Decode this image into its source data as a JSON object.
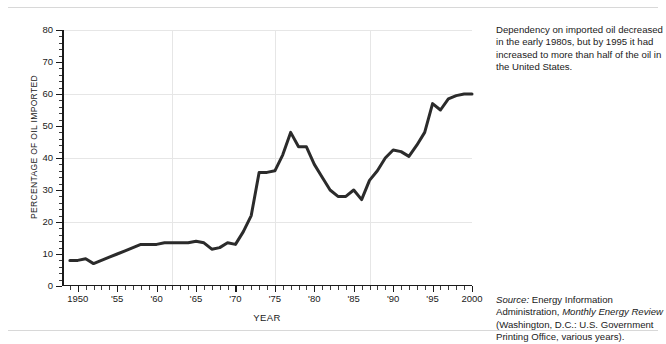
{
  "caption": "Dependency on imported oil decreased in the early 1980s, but by 1995 it had increased to more than half of the oil in the United States.",
  "source": {
    "label": "Source:",
    "text_before": " Energy Information Administration, ",
    "publication": "Monthly Energy Review",
    "text_after": " (Washington, D.C.: U.S. Government Printing Office, various years)."
  },
  "chart_data": {
    "type": "line",
    "title": "",
    "xlabel": "YEAR",
    "ylabel": "PERCENTAGE OF OIL IMPORTED",
    "xlim": [
      1948,
      2000
    ],
    "ylim": [
      0,
      80
    ],
    "grid": "major gridlines at y = 20, 40, 60, 80 and vertical gridlines at x = 1962, 1975, 1987",
    "legend": "none",
    "line_color": "#2b2b2b",
    "y_ticks": [
      0,
      10,
      20,
      30,
      40,
      50,
      60,
      70,
      80
    ],
    "y_tick_labels": [
      "0",
      "10",
      "20",
      "30",
      "40",
      "50",
      "60",
      "70",
      "80"
    ],
    "y_minor_tick_step": 2,
    "x_ticks": [
      1950,
      1955,
      1960,
      1965,
      1970,
      1975,
      1980,
      1985,
      1990,
      1995,
      2000
    ],
    "x_tick_labels": [
      "1950",
      "'55",
      "'60",
      "'65",
      "'70",
      "'75",
      "'80",
      "'85",
      "'90",
      "'95",
      "2000"
    ],
    "x_minor_tick_step": 1,
    "x": [
      1949,
      1950,
      1951,
      1952,
      1953,
      1954,
      1955,
      1956,
      1957,
      1958,
      1959,
      1960,
      1961,
      1962,
      1963,
      1964,
      1965,
      1966,
      1967,
      1968,
      1969,
      1970,
      1971,
      1972,
      1973,
      1974,
      1975,
      1976,
      1977,
      1978,
      1979,
      1980,
      1981,
      1982,
      1983,
      1984,
      1985,
      1986,
      1987,
      1988,
      1989,
      1990,
      1991,
      1992,
      1993,
      1994,
      1995,
      1996,
      1997,
      1998,
      1999,
      2000
    ],
    "values": [
      8,
      8,
      8.5,
      7,
      8,
      9,
      10,
      11,
      12,
      13,
      13,
      13,
      13.5,
      13.5,
      13.5,
      13.5,
      14,
      13.5,
      11.5,
      12,
      13.5,
      13,
      17,
      22,
      35.5,
      35.5,
      36,
      41,
      48,
      43.5,
      43.5,
      38,
      34,
      30,
      28,
      28,
      30,
      27,
      33,
      36,
      40,
      42.5,
      42,
      40.5,
      44,
      48,
      57,
      55,
      58.5,
      59.5,
      60,
      60
    ]
  }
}
